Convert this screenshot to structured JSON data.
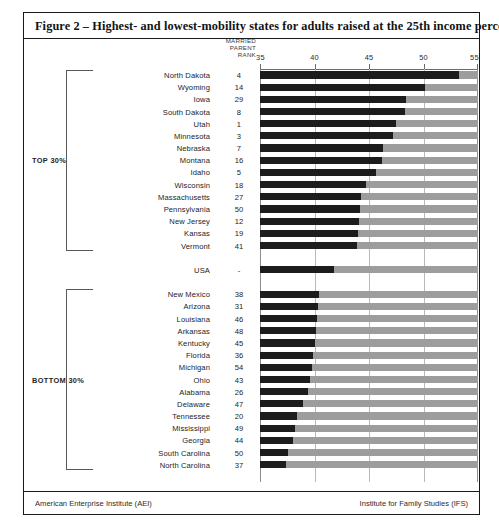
{
  "figure": {
    "title": "Figure 2 – Highest- and lowest-mobility states for adults raised at the 25th income percentile",
    "rank_header_line1": "MARRIED",
    "rank_header_line2": "PARENT",
    "rank_header_line3": "RANK",
    "group_top_label": "TOP 30%",
    "group_bottom_label": "BOTTOM 30%",
    "footer_left": "American Enterprise Institute (AEI)",
    "footer_right": "Institute for Family Studies (IFS)"
  },
  "colors": {
    "bar_dark": "#1c1c1c",
    "bar_light": "#9d9d9d",
    "grid": "#b9b9b9",
    "frame": "#1a1a1a",
    "text": "#242424"
  },
  "chart_data": {
    "type": "bar",
    "orientation": "horizontal",
    "title": "Figure 2 – Highest- and lowest-mobility states for adults raised at the 25th income percentile",
    "xlabel": "",
    "ylabel": "",
    "xlim": [
      35,
      55
    ],
    "xticks": [
      35,
      40,
      45,
      50,
      55
    ],
    "ticklabels": [
      "35",
      "40",
      "45",
      "50",
      "55"
    ],
    "grid": true,
    "legend": "none",
    "value_column_header": "MARRIED PARENT RANK",
    "groups": [
      {
        "name": "TOP 30%",
        "rows": [
          {
            "state": "North Dakota",
            "rank": "4",
            "value": 53.3
          },
          {
            "state": "Wyoming",
            "rank": "14",
            "value": 50.1
          },
          {
            "state": "Iowa",
            "rank": "29",
            "value": 48.4
          },
          {
            "state": "South Dakota",
            "rank": "8",
            "value": 48.3
          },
          {
            "state": "Utah",
            "rank": "1",
            "value": 47.5
          },
          {
            "state": "Minnesota",
            "rank": "3",
            "value": 47.2
          },
          {
            "state": "Nebraska",
            "rank": "7",
            "value": 46.3
          },
          {
            "state": "Montana",
            "rank": "16",
            "value": 46.2
          },
          {
            "state": "Idaho",
            "rank": "5",
            "value": 45.6
          },
          {
            "state": "Wisconsin",
            "rank": "18",
            "value": 44.7
          },
          {
            "state": "Massachusetts",
            "rank": "27",
            "value": 44.3
          },
          {
            "state": "Pennsylvania",
            "rank": "50",
            "value": 44.2
          },
          {
            "state": "New Jersey",
            "rank": "12",
            "value": 44.1
          },
          {
            "state": "Kansas",
            "rank": "19",
            "value": 44.0
          },
          {
            "state": "Vermont",
            "rank": "41",
            "value": 43.9
          }
        ]
      },
      {
        "name": "USA",
        "rows": [
          {
            "state": "USA",
            "rank": "-",
            "value": 41.8
          }
        ]
      },
      {
        "name": "BOTTOM 30%",
        "rows": [
          {
            "state": "New Mexico",
            "rank": "38",
            "value": 40.4
          },
          {
            "state": "Arizona",
            "rank": "31",
            "value": 40.3
          },
          {
            "state": "Louisiana",
            "rank": "46",
            "value": 40.2
          },
          {
            "state": "Arkansas",
            "rank": "48",
            "value": 40.1
          },
          {
            "state": "Kentucky",
            "rank": "45",
            "value": 40.0
          },
          {
            "state": "Florida",
            "rank": "36",
            "value": 39.9
          },
          {
            "state": "Michigan",
            "rank": "54",
            "value": 39.8
          },
          {
            "state": "Ohio",
            "rank": "43",
            "value": 39.6
          },
          {
            "state": "Alabama",
            "rank": "26",
            "value": 39.4
          },
          {
            "state": "Delaware",
            "rank": "47",
            "value": 38.9
          },
          {
            "state": "Tennessee",
            "rank": "20",
            "value": 38.4
          },
          {
            "state": "Mississippi",
            "rank": "49",
            "value": 38.2
          },
          {
            "state": "Georgia",
            "rank": "44",
            "value": 38.0
          },
          {
            "state": "South Carolina",
            "rank": "50",
            "value": 37.6
          },
          {
            "state": "North Carolina",
            "rank": "37",
            "value": 37.4
          }
        ]
      }
    ]
  }
}
